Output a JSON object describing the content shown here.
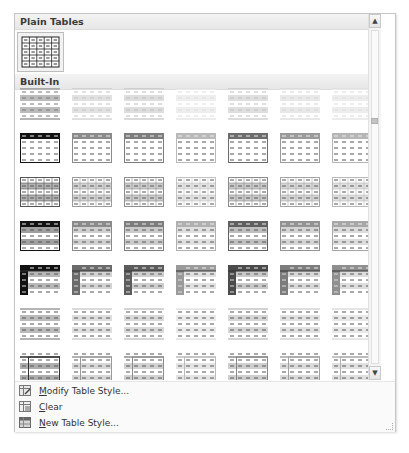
{
  "gallery": {
    "sections": [
      {
        "title": "Plain Tables"
      },
      {
        "title": "Built-In"
      }
    ],
    "plain_tables": [
      {
        "name": "Table Grid",
        "selected": true
      }
    ],
    "built_in": {
      "columns": 7,
      "rows": 7,
      "row_styles": [
        {
          "kind": "light-shading",
          "accents": [
            "#6a6a6a",
            "#bdbdbd",
            "#b5b5b5",
            "#dadada",
            "#b8b8b8",
            "#cfcfcf",
            "#d8d8d8"
          ]
        },
        {
          "kind": "light-list",
          "accents": [
            "#111111",
            "#8a8a8a",
            "#7d7d7d",
            "#b9b9b9",
            "#6c6c6c",
            "#9a9a9a",
            "#b5b5b5"
          ]
        },
        {
          "kind": "light-grid",
          "accents": [
            "#555555",
            "#9c9c9c",
            "#8f8f8f",
            "#c2c2c2",
            "#8b8b8b",
            "#a6a6a6",
            "#b9b9b9"
          ]
        },
        {
          "kind": "medium-shading-1",
          "accents": [
            "#111111",
            "#8a8a8a",
            "#7d7d7d",
            "#b0b0b0",
            "#5f5f5f",
            "#939393",
            "#a7a7a7"
          ]
        },
        {
          "kind": "medium-shading-2",
          "accents": [
            "#111111",
            "#6b6b6b",
            "#5c5c5c",
            "#9a9a9a",
            "#4b4b4b",
            "#7c7c7c",
            "#8f8f8f"
          ]
        },
        {
          "kind": "medium-list-1",
          "accents": [
            "#6a6a6a",
            "#b5b5b5",
            "#aaaaaa",
            "#d0d0d0",
            "#a4a4a4",
            "#bdbdbd",
            "#cccccc"
          ]
        },
        {
          "kind": "medium-list-2",
          "accents": [
            "#333333",
            "#9a9a9a",
            "#8d8d8d",
            "#bcbcbc",
            "#888888",
            "#a2a2a2",
            "#b2b2b2"
          ]
        }
      ]
    },
    "scrollbar": {
      "up_arrow": "▲",
      "down_arrow": "▼"
    }
  },
  "menu": {
    "items": [
      {
        "id": "modify",
        "mnemonic": "M",
        "rest": "odify Table Style...",
        "icon": "modify-table-style-icon"
      },
      {
        "id": "clear",
        "mnemonic": "C",
        "rest": "lear",
        "icon": "clear-table-icon"
      },
      {
        "id": "new",
        "mnemonic": "N",
        "rest": "ew Table Style...",
        "icon": "new-table-style-icon"
      }
    ]
  }
}
